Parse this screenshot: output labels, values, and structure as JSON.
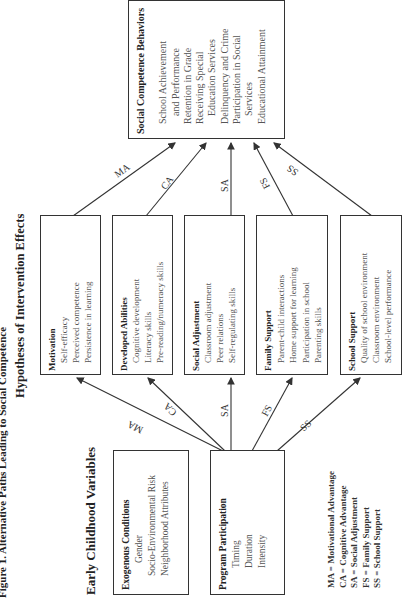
{
  "figure": {
    "title_line1": "Figure 1. Alternative Paths Leading to Social Competence",
    "title_line2": "Hypotheses of Intervention Effects",
    "orientation": "rotated 90 degrees counter-clockwise"
  },
  "outcome": {
    "title": "Social Competence Behaviors",
    "items": [
      "School Achievement",
      "and Performance",
      "Retention in Grade",
      "Receiving Special",
      "Education Services",
      "Delinquency and Crime",
      "Participation in Social",
      "Services",
      "Educational Attainment"
    ]
  },
  "mediators": [
    {
      "title": "Motivation",
      "items": [
        "Self-efficacy",
        "Perceived competence",
        "Persistence in learning"
      ]
    },
    {
      "title": "Developed Abilities",
      "items": [
        "Cognitive development",
        "Literacy skills",
        "Pre-reading/numeracy skills"
      ]
    },
    {
      "title": "Social Adjustment",
      "items": [
        "Classroom adjustment",
        "Peer relations",
        "Self-regulating skills"
      ]
    },
    {
      "title": "Family Support",
      "items": [
        "Parent-child interactions",
        "Home support for learning",
        "Participation in school",
        "Parenting skills"
      ]
    },
    {
      "title": "School Support",
      "items": [
        "Quality of school environment",
        "Classroom environment",
        "School-level performance"
      ]
    }
  ],
  "early_childhood": {
    "heading": "Early Childhood Variables",
    "exogenous": {
      "title": "Exogenous Conditions",
      "items": [
        "Gender",
        "Socio-Environmental Risk",
        "Neighborhood  Attributes"
      ]
    },
    "program": {
      "title": "Program Participation",
      "items": [
        "Timing",
        "Duration",
        "Intensity"
      ]
    }
  },
  "paths": {
    "upper": [
      "MA",
      "CA",
      "SA",
      "FS",
      "SS"
    ],
    "lower": [
      "MA",
      "CA",
      "SA",
      "FS",
      "SS"
    ]
  },
  "legend": [
    "MA = Motivational Advantage",
    "CA = Cognitive Advantage",
    "SA = Social Adjustment",
    "FS = Family Support",
    "SS = School Support"
  ]
}
